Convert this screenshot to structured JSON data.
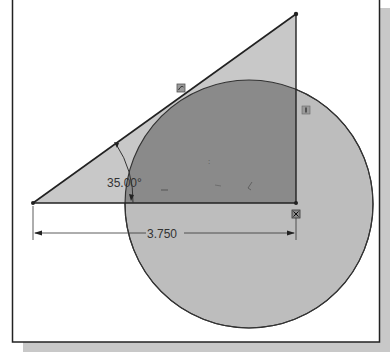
{
  "diagram": {
    "dimensions": {
      "angle_label": "35.00°",
      "length_label": "3.750"
    },
    "relations": [
      {
        "name": "tangent-relation-icon",
        "meaning": "tangent"
      },
      {
        "name": "vertical-relation-icon",
        "meaning": "vertical"
      },
      {
        "name": "coincident-relation-icon",
        "meaning": "coincident"
      }
    ],
    "colors": {
      "frame": "#222222",
      "shadow": "#c8c8c8",
      "triangle_fill": "#c4c4c4",
      "circle_fill": "#bdbdbd",
      "overlap_fill": "#8c8c8c",
      "line": "#2a2a2a"
    }
  }
}
